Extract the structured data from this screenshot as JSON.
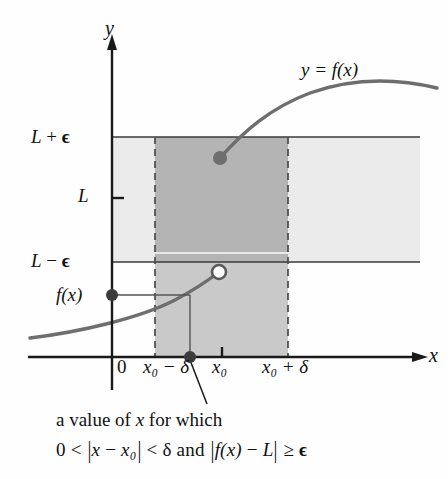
{
  "figure": {
    "type": "calculus-epsilon-delta-diagram",
    "title_visible": false,
    "background_color": "#fefefe",
    "ink_color": "#111111",
    "curve_color": "#6e6e6e",
    "band_light_color": "#ebebeb",
    "band_dark_color": "#b4b4b4",
    "strip_mid_color": "#c9c9c9",
    "dashed_color": "#555555"
  },
  "axes": {
    "y_label": "y",
    "x_label": "x",
    "origin_label": "0"
  },
  "y_ticks": [
    {
      "id": "L-plus-eps",
      "label_html": "L + ϵ",
      "L": "L",
      "op": "+",
      "eps": "ϵ",
      "pixel_y": 137
    },
    {
      "id": "L",
      "label_html": "L",
      "L": "L",
      "op": "",
      "eps": "",
      "pixel_y": 198
    },
    {
      "id": "L-minus-eps",
      "label_html": "L − ϵ",
      "L": "L",
      "op": "−",
      "eps": "ϵ",
      "pixel_y": 262
    },
    {
      "id": "f-of-x",
      "label_html": "f(x)",
      "L": "",
      "op": "",
      "eps": "",
      "pixel_y": 295
    }
  ],
  "x_ticks": [
    {
      "id": "zero",
      "label": "0",
      "pixel_x": 112
    },
    {
      "id": "x0-minus-d",
      "label": "x₀ − δ",
      "pixel_x": 155
    },
    {
      "id": "x0",
      "label": "x₀",
      "pixel_x": 222
    },
    {
      "id": "x0-plus-d",
      "label": "x₀ + δ",
      "pixel_x": 288
    }
  ],
  "curve": {
    "label": "y = f(x)",
    "equation_y": "y",
    "equation_eq": "=",
    "equation_f": "f",
    "equation_arg": "(x)"
  },
  "points": {
    "open_circle": {
      "name": "right-hand-limit-open-point",
      "pixel_x": 219,
      "pixel_y": 272,
      "filled": false
    },
    "upper_dot": {
      "name": "function-value-dot-upper-branch",
      "pixel_x": 220,
      "pixel_y": 158,
      "filled": true
    },
    "axis_dot": {
      "name": "x-value-dot-on-axis",
      "pixel_x": 190,
      "pixel_y": 357,
      "filled": true
    },
    "fx_dot": {
      "name": "f-of-x-value-dot-on-y-axis",
      "pixel_x": 112,
      "pixel_y": 295,
      "filled": true
    }
  },
  "caption": {
    "line1": "a value of x for which",
    "line1_parts": {
      "a_value_of": "a value of",
      "x": "x",
      "for_which": "for which"
    },
    "line2": "0 < |x − x₀| < δ and |f(x) − L| ≥ ϵ",
    "line2_parts": {
      "zero": "0",
      "lt1": "<",
      "abs_open": "|",
      "x": "x",
      "minus": "−",
      "x0": "x₀",
      "abs_close": "|",
      "lt2": "<",
      "delta": "δ",
      "and": "and",
      "fx": "f(x)",
      "minus2": "−",
      "L": "L",
      "geq": "≥",
      "epsilon": "ϵ"
    }
  },
  "symbols": {
    "epsilon": "ϵ",
    "delta": "δ",
    "minus": "−",
    "plus": "+",
    "subscript_zero": "₀",
    "geq": "≥",
    "lt": "<"
  }
}
